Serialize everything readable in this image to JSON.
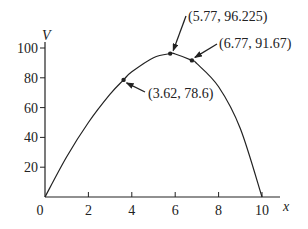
{
  "chart_data": {
    "type": "line",
    "title": "",
    "xlabel": "x",
    "ylabel": "V",
    "xlim": [
      0,
      10
    ],
    "ylim": [
      0,
      100
    ],
    "grid": false,
    "legend": null,
    "x_ticks": [
      0,
      2,
      4,
      6,
      8,
      10
    ],
    "x_tick_labels": [
      "0",
      "2",
      "4",
      "6",
      "8",
      "10"
    ],
    "y_ticks": [
      20,
      40,
      60,
      80,
      100
    ],
    "y_tick_labels": [
      "20",
      "40",
      "60",
      "80",
      "100"
    ],
    "series": [
      {
        "name": "V(x)",
        "x": [
          0,
          1,
          2,
          3,
          3.62,
          4,
          5,
          5.77,
          6,
          6.77,
          7,
          8,
          9,
          10
        ],
        "values": [
          0,
          27,
          50,
          69,
          78.6,
          84,
          93.5,
          96.225,
          96,
          91.67,
          89.5,
          74,
          46,
          0
        ]
      }
    ],
    "annotations": [
      {
        "label": "(3.62, 78.6)",
        "x": 3.62,
        "y": 78.6
      },
      {
        "label": "(5.77, 96.225)",
        "x": 5.77,
        "y": 96.225
      },
      {
        "label": "(6.77, 91.67)",
        "x": 6.77,
        "y": 91.67
      }
    ]
  },
  "colors": {
    "line": "#222222",
    "background": "#ffffff"
  }
}
